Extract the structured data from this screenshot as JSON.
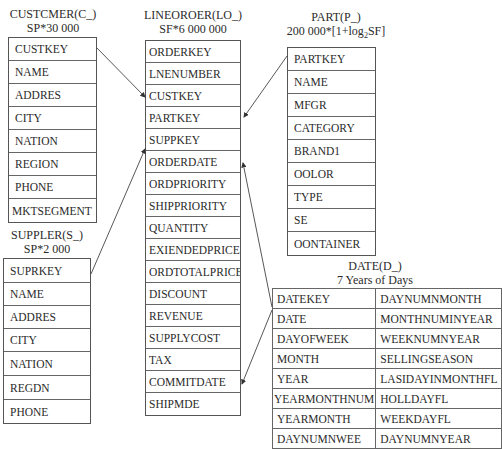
{
  "diagram_type": "star-schema",
  "tables": {
    "customer": {
      "name": "CUSTCMER(C_)",
      "cardinality": "SP*30 000",
      "fields": [
        "CUSTKEY",
        "NAME",
        "ADDRES",
        "CITY",
        "NATION",
        "REGION",
        "PHONE",
        "MKTSEGMENT"
      ]
    },
    "lineorder": {
      "name": "LINEOROER(LO_)",
      "cardinality": "SF*6 000 000",
      "fields": [
        "ORDERKEY",
        "LNENUMBER",
        "CUSTKEY",
        "PARTKEY",
        "SUPPKEY",
        "ORDERDATE",
        "ORDPRIORITY",
        "SHIPPRIORITY",
        "QUANTITY",
        "EXIENDEDPRICE",
        "ORDTOTALPRICE",
        "DISCOUNT",
        "REVENUE",
        "SUPPLYCOST",
        "TAX",
        "COMMITDATE",
        "SHIPMDE"
      ]
    },
    "part": {
      "name": "PART(P_)",
      "cardinality_prefix": "200 000*[1+log",
      "cardinality_sub": "2",
      "cardinality_suffix": "SF]",
      "fields": [
        "PARTKEY",
        "NAME",
        "MFGR",
        "CATEGORY",
        "BRAND1",
        "OOLOR",
        "TYPE",
        "SE",
        "OONTAINER"
      ]
    },
    "supplier": {
      "name": "SUPPLER(S_)",
      "cardinality": "SP*2 000",
      "fields": [
        "SUPRKEY",
        "NAME",
        "ADDRES",
        "CITY",
        "NATION",
        "REGDN",
        "PHONE"
      ]
    },
    "date": {
      "name": "DATE(D_)",
      "cardinality": "7 Years of Days",
      "fields_left": [
        "DATEKEY",
        "DATE",
        "DAYOFWEEK",
        "MONTH",
        "YEAR",
        "YEARMONTHNUM",
        "YEARMONTH",
        "DAYNUMNWEE"
      ],
      "fields_right": [
        "DAYNUMNMONTH",
        "MONTHNUMINYEAR",
        "WEEKNUMNYEAR",
        "SELLINGSEASON",
        "LASIDAYINMONTHFL",
        "HOLLDAYFL",
        "WEEKDAYFL",
        "DAYNUMNYEAR"
      ]
    }
  },
  "relationships": [
    {
      "from": "CUSTCMER.CUSTKEY",
      "to": "LINEOROER.CUSTKEY"
    },
    {
      "from": "PART.PARTKEY",
      "to": "LINEOROER.PARTKEY"
    },
    {
      "from": "SUPPLER.SUPRKEY",
      "to": "LINEOROER.SUPPKEY"
    },
    {
      "from": "DATE.DATE",
      "to": "LINEOROER.ORDERDATE"
    },
    {
      "from": "DATE.DATE",
      "to": "LINEOROER.COMMITDATE"
    }
  ],
  "colors": {
    "line": "#444444",
    "border": "#555555",
    "text": "#2a2a2a"
  }
}
